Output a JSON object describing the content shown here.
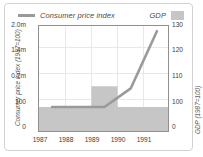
{
  "chart_data": {
    "type": "line",
    "title": "",
    "xlabel": "",
    "categories": [
      "1987",
      "1988",
      "1989",
      "1990",
      "1991"
    ],
    "grid": true,
    "legend_position": "top",
    "axes": {
      "left": {
        "label": "Consumer price index (1987=100)",
        "ticks": [
          "0",
          "100",
          "0.7m",
          "1.4m",
          "2.0m"
        ],
        "tick_values": [
          0,
          100,
          700000,
          1400000,
          2000000
        ],
        "ylim": [
          0,
          2000000
        ]
      },
      "right": {
        "label": "GDP (1987=100)",
        "ticks": [
          "0",
          "100",
          "110",
          "120",
          "130"
        ],
        "tick_values": [
          0,
          100,
          110,
          120,
          130
        ],
        "ylim": [
          0,
          130
        ]
      }
    },
    "series": [
      {
        "name": "Consumer price index",
        "type": "line",
        "axis": "left",
        "color": "#9a9a9a",
        "x": [
          "1987",
          "1988",
          "1989",
          "1990",
          "1991"
        ],
        "values": [
          100,
          100,
          100,
          500000,
          1950000
        ]
      },
      {
        "name": "GDP",
        "type": "area",
        "axis": "right",
        "color": "#c6c6c6",
        "x": [
          "1987",
          "1988",
          "1989",
          "1990",
          "1991"
        ],
        "values": [
          100,
          100,
          108,
          100,
          100
        ]
      }
    ]
  },
  "legend": {
    "cpi_label": "Consumer price index",
    "gdp_label": "GDP"
  },
  "axis_titles": {
    "left": "Consumer price index (1987=100)",
    "right": "GDP (1987=100)"
  },
  "ticks": {
    "left": [
      "2.0m",
      "1.4m",
      "0.7m",
      "100",
      "0"
    ],
    "right": [
      "130",
      "120",
      "110",
      "100",
      "0"
    ],
    "x": [
      "1987",
      "1988",
      "1989",
      "1990",
      "1991"
    ]
  }
}
